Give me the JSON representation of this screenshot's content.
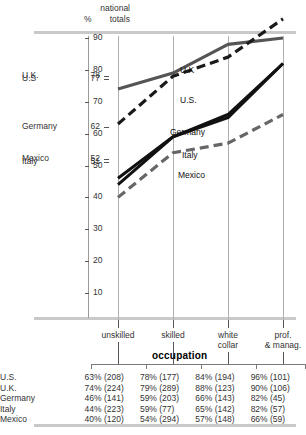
{
  "header": {
    "national_totals_label": "national\ntotals",
    "percent_symbol": "%"
  },
  "national_totals": [
    {
      "name": "U.K.",
      "value": "78"
    },
    {
      "name": "U.S",
      "value": "77"
    },
    {
      "name": "Germany",
      "value": "62"
    },
    {
      "name": "Mexico",
      "value": "52"
    },
    {
      "name": "Italy",
      "value": "51"
    }
  ],
  "axis": {
    "y_ticks": [
      "90",
      "80",
      "70",
      "60",
      "50",
      "40",
      "30",
      "20",
      "10"
    ],
    "y_min": 0,
    "y_max": 95
  },
  "occupation_title": "occupation",
  "curve_labels": [
    "U.K",
    "U.S.",
    "Germany",
    "Italy",
    "Mexico"
  ],
  "table": {
    "columns": [
      "unskilled",
      "skilled",
      "white collar",
      "prof. & manag."
    ],
    "rows": [
      {
        "name": "U.S.",
        "cells": [
          "63% (208)",
          "78% (177)",
          "84% (194)",
          "96% (101)"
        ]
      },
      {
        "name": "U.K.",
        "cells": [
          "74% (224)",
          "79% (289)",
          "88% (123)",
          "90% (106)"
        ]
      },
      {
        "name": "Germany",
        "cells": [
          "46% (141)",
          "59% (203)",
          "66% (143)",
          "82% (45)"
        ]
      },
      {
        "name": "Italy",
        "cells": [
          "44% (223)",
          "59% (77)",
          "65% (142)",
          "82% (57)"
        ]
      },
      {
        "name": "Mexico",
        "cells": [
          "40% (120)",
          "54% (294)",
          "57% (148)",
          "66% (59)"
        ]
      }
    ]
  },
  "chart_data": {
    "type": "line",
    "title": "",
    "xlabel": "occupation",
    "ylabel": "%",
    "categories": [
      "unskilled",
      "skilled",
      "white collar",
      "prof. & manag."
    ],
    "ylim": [
      0,
      95
    ],
    "grid": true,
    "legend": "inline-labels",
    "series": [
      {
        "name": "U.K.",
        "values": [
          74,
          79,
          88,
          90
        ],
        "style": "solid",
        "color": "#555555",
        "width": 3.2
      },
      {
        "name": "U.S.",
        "values": [
          63,
          78,
          84,
          96
        ],
        "style": "dashed",
        "color": "#1a1a1a",
        "width": 3.2
      },
      {
        "name": "Germany",
        "values": [
          46,
          59,
          66,
          82
        ],
        "style": "solid",
        "color": "#111111",
        "width": 3.0
      },
      {
        "name": "Italy",
        "values": [
          44,
          59,
          65,
          82
        ],
        "style": "solid",
        "color": "#111111",
        "width": 3.0
      },
      {
        "name": "Mexico",
        "values": [
          40,
          54,
          57,
          66
        ],
        "style": "dashed",
        "color": "#666666",
        "width": 3.2
      }
    ]
  },
  "colors": {
    "rule_gray": "#c9c9c9",
    "gridline": "#b0b0b0",
    "dark_line": "#111111",
    "gray_line": "#555555",
    "light_gray_line": "#666666"
  }
}
